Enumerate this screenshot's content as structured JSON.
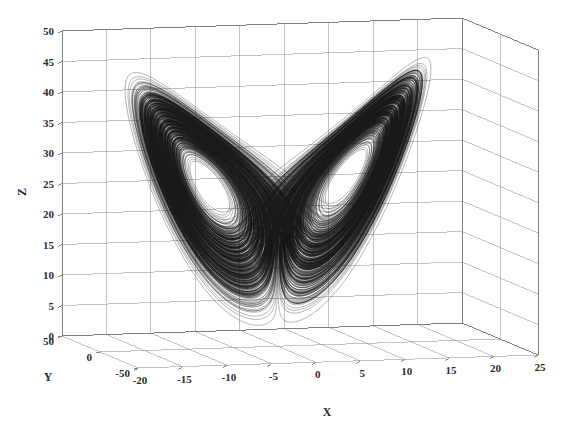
{
  "figure": {
    "type": "3d-line-plot",
    "background_color": "#ffffff",
    "grid_color": "#9a9a9a",
    "box_color": "#7a7a7a",
    "curve_color": "#1a1a1a",
    "text_color": "#2b2b2b"
  },
  "chart_data": {
    "type": "line",
    "title": "",
    "subtitle": "",
    "projection": "3d",
    "xlabel": "X",
    "ylabel": "Y",
    "zlabel": "Z",
    "xlim": [
      -20,
      25
    ],
    "ylim": [
      -50,
      50
    ],
    "zlim": [
      0,
      50
    ],
    "xticks": [
      -20,
      -15,
      -10,
      -5,
      0,
      5,
      10,
      15,
      20,
      25
    ],
    "xtick_labels": [
      "-20",
      "-15",
      "-10",
      "-5",
      "0",
      "5",
      "10",
      "15",
      "20",
      "25"
    ],
    "yticks": [
      50,
      0,
      -50
    ],
    "ytick_labels": [
      "50",
      "0",
      "-50"
    ],
    "zticks": [
      0,
      5,
      10,
      15,
      20,
      25,
      30,
      35,
      40,
      45,
      50
    ],
    "ztick_labels": [
      "0",
      "5",
      "10",
      "15",
      "20",
      "25",
      "30",
      "35",
      "40",
      "45",
      "50"
    ],
    "grid": true,
    "legend": null,
    "series": [
      {
        "name": "Lorenz trajectory",
        "color": "#1a1a1a",
        "style": "solid-dense",
        "system": "Lorenz equations",
        "lobes": 2,
        "left_lobe_center": {
          "x": -9.0,
          "y": -9.0,
          "z": 22.0
        },
        "right_lobe_center": {
          "x": 9.0,
          "y": 9.0,
          "z": 22.0
        },
        "z_range_observed": [
          1,
          46
        ],
        "x_range_observed": [
          -18,
          19
        ],
        "y_range_observed": [
          -25,
          25
        ]
      }
    ]
  },
  "axes": {
    "x_label": "X",
    "y_label": "Y",
    "z_label": "Z"
  },
  "x_ticks": [
    "-20",
    "-15",
    "-10",
    "-5",
    "0",
    "5",
    "10",
    "15",
    "20",
    "25"
  ],
  "y_ticks": [
    "50",
    "0",
    "-50"
  ],
  "z_ticks": [
    "0",
    "5",
    "10",
    "15",
    "20",
    "25",
    "30",
    "35",
    "40",
    "45",
    "50"
  ]
}
